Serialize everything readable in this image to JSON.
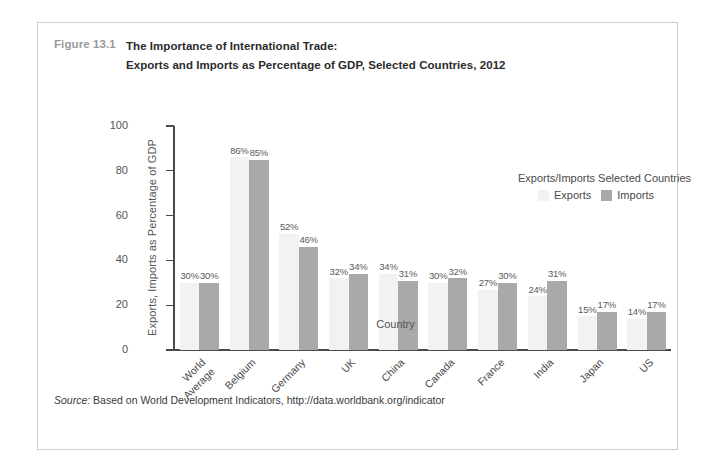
{
  "figure": {
    "number": "Figure 13.1",
    "title_line1": "The Importance of International Trade:",
    "title_line2": "Exports and Imports as Percentage of GDP, Selected Countries, 2012",
    "source_label": "Source:",
    "source_text": "Based on World Development Indicators, http://data.worldbank.org/indicator"
  },
  "legend": {
    "title": "Exports/Imports Selected Countries",
    "exports_label": "Exports",
    "imports_label": "Imports"
  },
  "colors": {
    "exports": "#f2f2f2",
    "imports": "#a9a9a9",
    "axis": "#4a4a4a",
    "frame": "#cfcfcf",
    "figure_number": "#9a9a9a"
  },
  "chart_data": {
    "type": "bar",
    "title": "The Importance of International Trade: Exports and Imports as Percentage of GDP, Selected Countries, 2012",
    "xlabel": "Country",
    "ylabel": "Exports, Imports as Percentage of GDP",
    "ylim": [
      0,
      100
    ],
    "yticks": [
      0,
      20,
      40,
      60,
      80,
      100
    ],
    "ytick_labels": [
      "0",
      "20",
      "40",
      "60",
      "80",
      "100"
    ],
    "grid": false,
    "legend_position": "upper-right-inside",
    "categories": [
      "World\nAverage",
      "Belgium",
      "Germany",
      "UK",
      "China",
      "Canada",
      "France",
      "India",
      "Japan",
      "US"
    ],
    "series": [
      {
        "name": "Exports",
        "values": [
          30,
          86,
          52,
          32,
          34,
          30,
          27,
          24,
          15,
          14
        ],
        "labels": [
          "30%",
          "86%",
          "52%",
          "32%",
          "34%",
          "30%",
          "27%",
          "24%",
          "15%",
          "14%"
        ]
      },
      {
        "name": "Imports",
        "values": [
          30,
          85,
          46,
          34,
          31,
          32,
          30,
          31,
          17,
          17
        ],
        "labels": [
          "30%",
          "85%",
          "46%",
          "34%",
          "31%",
          "32%",
          "30%",
          "31%",
          "17%",
          "17%"
        ]
      }
    ]
  }
}
